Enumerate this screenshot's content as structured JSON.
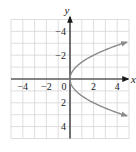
{
  "chart_data": {
    "type": "line",
    "title": "",
    "xlabel": "x",
    "ylabel": "y",
    "xlim": [
      -5,
      5
    ],
    "ylim": [
      -5,
      5
    ],
    "grid": true,
    "x_ticks": [
      -4,
      -2,
      0,
      2,
      4
    ],
    "y_ticks": [
      -4,
      -2,
      2,
      4
    ],
    "tick_labels": {
      "x": [
        "−4",
        "−2",
        "0",
        "2",
        "4"
      ],
      "y": [
        "4",
        "2",
        "−2",
        "−4"
      ]
    },
    "series": [
      {
        "name": "x = y^2 / 2 (sideways parabola)",
        "equation": "x = y^2/2",
        "points": [
          {
            "x": 4.5,
            "y": 3
          },
          {
            "x": 2,
            "y": 2
          },
          {
            "x": 0.5,
            "y": 1
          },
          {
            "x": 0,
            "y": 0
          },
          {
            "x": 0.5,
            "y": -1
          },
          {
            "x": 2,
            "y": -2
          },
          {
            "x": 4.5,
            "y": -3
          }
        ],
        "arrows_at_ends": true,
        "color": "#8a8a8a"
      }
    ],
    "colors": {
      "grid": "#d6d6d6",
      "axes": "#1a1a1a",
      "curve": "#8a8a8a"
    }
  }
}
